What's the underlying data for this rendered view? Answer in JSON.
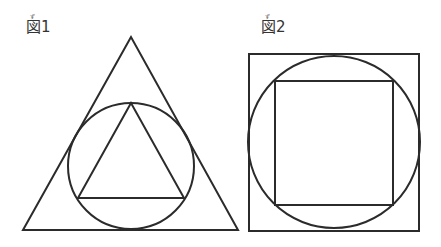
{
  "figures": [
    {
      "label": "図1",
      "ruby": "ず",
      "description": "Circle inscribed in an equilateral triangle, with an equilateral triangle inscribed in the circle",
      "outer_triangle": {
        "points": [
          [
            131,
            37
          ],
          [
            23,
            230
          ],
          [
            238,
            230
          ]
        ]
      },
      "circle": {
        "cx": 131,
        "cy": 166,
        "r": 63
      },
      "inner_triangle": {
        "points": [
          [
            131,
            103
          ],
          [
            78,
            198
          ],
          [
            184,
            198
          ]
        ]
      }
    },
    {
      "label": "図2",
      "ruby": "ず",
      "description": "Circle inscribed in a square, with a square inscribed in the circle",
      "outer_square": {
        "x": 249,
        "y": 54,
        "width": 170,
        "height": 177
      },
      "circle": {
        "cx": 334,
        "cy": 142,
        "r": 86
      },
      "inner_square": {
        "x": 275,
        "y": 81,
        "width": 118,
        "height": 124
      }
    }
  ],
  "colors": {
    "stroke": "#2b2b2b",
    "background": "#ffffff"
  }
}
